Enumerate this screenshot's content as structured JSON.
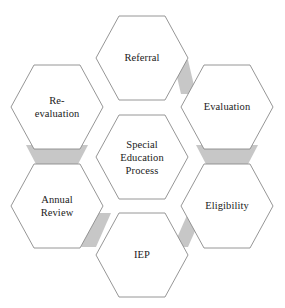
{
  "diagram": {
    "title": "Special Education Process",
    "type": "hexagon-cycle",
    "canvas": {
      "width": 285,
      "height": 308,
      "background": "#ffffff"
    },
    "style": {
      "hex_outline_color": "#8a8a8a",
      "hex_fill_color": "#ffffff",
      "overlap_fill_color": "#c7c7c7",
      "text_color": "#1a1a1a"
    },
    "center_node": {
      "id": "special-education-process",
      "label": "Special\nEducation\nProcess",
      "cx": 142,
      "cy": 157
    },
    "nodes": [
      {
        "id": "referral",
        "label": "Referral",
        "cx": 142,
        "cy": 58,
        "position": "top"
      },
      {
        "id": "evaluation",
        "label": "Evaluation",
        "cx": 227,
        "cy": 107,
        "position": "top-right"
      },
      {
        "id": "eligibility",
        "label": "Eligibility",
        "cx": 227,
        "cy": 206,
        "position": "bottom-right"
      },
      {
        "id": "iep",
        "label": "IEP",
        "cx": 142,
        "cy": 255,
        "position": "bottom"
      },
      {
        "id": "annual-review",
        "label": "Annual\nReview",
        "cx": 57,
        "cy": 206,
        "position": "bottom-left"
      },
      {
        "id": "re-evaluation",
        "label": "Re-\nevaluation",
        "cx": 57,
        "cy": 107,
        "position": "top-left"
      }
    ],
    "flow_overlaps": [
      {
        "id": "referral-to-evaluation",
        "from": "referral",
        "to": "evaluation",
        "shape": "parallelogram"
      },
      {
        "id": "evaluation-to-eligibility",
        "from": "evaluation",
        "to": "eligibility",
        "shape": "trapezoid"
      },
      {
        "id": "eligibility-to-iep",
        "from": "eligibility",
        "to": "iep",
        "shape": "parallelogram"
      },
      {
        "id": "iep-to-annual-review",
        "from": "iep",
        "to": "annual-review",
        "shape": "parallelogram"
      },
      {
        "id": "annual-review-to-re-evaluation",
        "from": "annual-review",
        "to": "re-evaluation",
        "shape": "trapezoid"
      }
    ]
  }
}
